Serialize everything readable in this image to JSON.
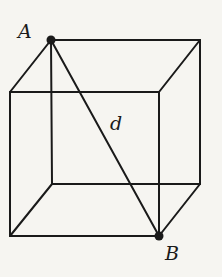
{
  "diagram": {
    "type": "cube-space-diagonal",
    "labels": {
      "vertex_top": "A",
      "vertex_bottom": "B",
      "diagonal": "d"
    },
    "colors": {
      "background": "#f6f5f1",
      "line": "#1a1a1a"
    }
  }
}
